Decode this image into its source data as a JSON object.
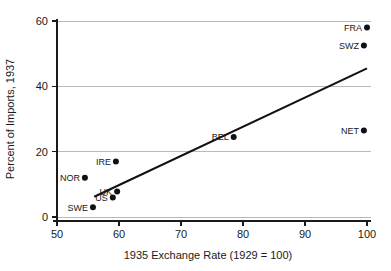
{
  "chart_data": {
    "type": "scatter",
    "title": "",
    "xlabel": "1935 Exchange Rate (1929 = 100)",
    "ylabel": "Percent of Imports, 1937",
    "xlim": [
      50,
      100
    ],
    "ylim": [
      0,
      60
    ],
    "xticks": [
      50,
      60,
      70,
      80,
      90,
      100
    ],
    "yticks": [
      0,
      20,
      40,
      60
    ],
    "xtick_labels": [
      "50",
      "60",
      "70",
      "80",
      "90",
      "100"
    ],
    "ytick_labels": [
      "0",
      "20",
      "40",
      "60"
    ],
    "grid": "horizontal",
    "legend": "none",
    "points": [
      {
        "label": "FRA",
        "x": 100.0,
        "y": 58.0,
        "label_pos": "left"
      },
      {
        "label": "SWZ",
        "x": 99.5,
        "y": 52.5,
        "label_pos": "left"
      },
      {
        "label": "NET",
        "x": 99.5,
        "y": 26.5,
        "label_pos": "left"
      },
      {
        "label": "BEL",
        "x": 78.5,
        "y": 24.5,
        "label_pos": "left"
      },
      {
        "label": "IRE",
        "x": 59.5,
        "y": 17.0,
        "label_pos": "left"
      },
      {
        "label": "NOR",
        "x": 54.5,
        "y": 12.0,
        "label_pos": "left"
      },
      {
        "label": "UK",
        "x": 59.7,
        "y": 7.8,
        "label_pos": "left"
      },
      {
        "label": "US",
        "x": 59.0,
        "y": 6.0,
        "label_pos": "left"
      },
      {
        "label": "SWE",
        "x": 55.8,
        "y": 3.0,
        "label_pos": "left"
      }
    ],
    "fit_line": {
      "x_start": 56.0,
      "y_start": 6.2,
      "x_end": 100.0,
      "y_end": 45.5
    }
  },
  "colors": {
    "marker": "#111111",
    "fit_line": "#111111",
    "gridline": "#b9b9b9",
    "axis": "#1a1a1a",
    "background": "#ffffff"
  }
}
